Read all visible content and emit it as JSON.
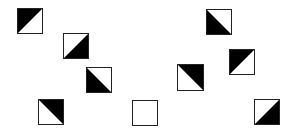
{
  "diagram": {
    "colors": {
      "fill": "#000000",
      "empty": "#ffffff",
      "border": "#222222"
    },
    "tiles": [
      {
        "id": 1,
        "x": 17,
        "y": 8,
        "size": 26,
        "black_half": "top-left"
      },
      {
        "id": 2,
        "x": 63,
        "y": 33,
        "size": 26,
        "black_half": "bottom-right"
      },
      {
        "id": 3,
        "x": 86,
        "y": 67,
        "size": 26,
        "black_half": "bottom-left"
      },
      {
        "id": 4,
        "x": 38,
        "y": 99,
        "size": 26,
        "black_half": "top-right"
      },
      {
        "id": 5,
        "x": 132,
        "y": 100,
        "size": 26,
        "black_half": "none"
      },
      {
        "id": 6,
        "x": 206,
        "y": 9,
        "size": 26,
        "black_half": "bottom-left"
      },
      {
        "id": 7,
        "x": 229,
        "y": 49,
        "size": 26,
        "black_half": "top-left"
      },
      {
        "id": 8,
        "x": 177,
        "y": 64,
        "size": 27,
        "black_half": "top-right"
      },
      {
        "id": 9,
        "x": 254,
        "y": 99,
        "size": 26,
        "black_half": "bottom-right"
      }
    ]
  }
}
